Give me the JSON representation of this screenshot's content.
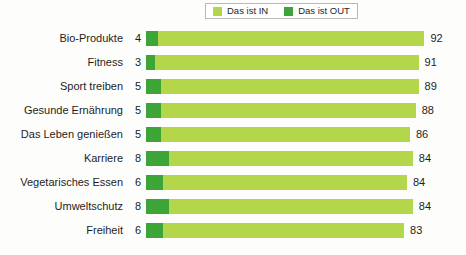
{
  "legend": {
    "entries": [
      {
        "label": "Das ist IN",
        "color": "#b3d64b",
        "icon": "legend-swatch-in"
      },
      {
        "label": "Das ist OUT",
        "color": "#3da437",
        "icon": "legend-swatch-out"
      }
    ]
  },
  "colors": {
    "in": "#b3d64b",
    "out": "#3da437",
    "background": "#fdfdfb",
    "text": "#1d1d1d",
    "legend_border": "#b9b9b9"
  },
  "chart_data": {
    "type": "bar",
    "orientation": "horizontal",
    "stacked": true,
    "title": "",
    "subtitle": "",
    "xlabel": "",
    "ylabel": "",
    "xlim": [
      0,
      100
    ],
    "grid": false,
    "legend_position": "top-center",
    "categories": [
      "Bio-Produkte",
      "Fitness",
      "Sport treiben",
      "Gesunde Ernährung",
      "Das Leben genießen",
      "Karriere",
      "Vegetarisches Essen",
      "Umweltschutz",
      "Freiheit"
    ],
    "series": [
      {
        "name": "Das ist OUT",
        "color": "#3da437",
        "values": [
          4,
          3,
          5,
          5,
          5,
          8,
          6,
          8,
          6
        ]
      },
      {
        "name": "Das ist IN",
        "color": "#b3d64b",
        "values": [
          92,
          91,
          89,
          88,
          86,
          84,
          84,
          84,
          83
        ]
      }
    ],
    "rows": [
      {
        "category": "Bio-Produkte",
        "out": 4,
        "in": 92
      },
      {
        "category": "Fitness",
        "out": 3,
        "in": 91
      },
      {
        "category": "Sport treiben",
        "out": 5,
        "in": 89
      },
      {
        "category": "Gesunde Ernährung",
        "out": 5,
        "in": 88
      },
      {
        "category": "Das Leben genießen",
        "out": 5,
        "in": 86
      },
      {
        "category": "Karriere",
        "out": 8,
        "in": 84
      },
      {
        "category": "Vegetarisches Essen",
        "out": 6,
        "in": 84
      },
      {
        "category": "Umweltschutz",
        "out": 8,
        "in": 84
      },
      {
        "category": "Freiheit",
        "out": 6,
        "in": 83
      }
    ]
  }
}
